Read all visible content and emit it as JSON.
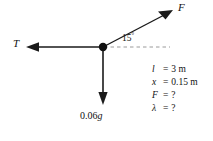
{
  "figure": {
    "background_color": "#ffffff",
    "line_color": "#1a1a1a",
    "dashed_color": "#9a9a9a"
  },
  "node": {
    "label": "junction-point",
    "x": 103,
    "y": 47
  },
  "vectors": [
    {
      "id": "tension",
      "label": "T",
      "direction": "left",
      "label_x": 13,
      "label_y": 39
    },
    {
      "id": "applied-force",
      "label": "F",
      "direction": "up-right",
      "label_x": 178,
      "label_y": 3
    },
    {
      "id": "weight",
      "label": "0.06g",
      "label_prefix": "0.06",
      "label_symbol": "g",
      "direction": "down",
      "label_x": 80,
      "label_y": 112
    }
  ],
  "angle": {
    "value": "15",
    "degree_symbol": "°",
    "label_x": 122,
    "label_y": 33,
    "reference": "dashed-horizontal"
  },
  "given": {
    "rows": [
      {
        "symbol": "l",
        "equals": "=",
        "value": "3 m"
      },
      {
        "symbol": "x",
        "equals": "=",
        "value": "0.15 m"
      },
      {
        "symbol": "F",
        "equals": "=",
        "value": "?"
      },
      {
        "symbol": "λ",
        "equals": "=",
        "value": "?"
      }
    ]
  }
}
